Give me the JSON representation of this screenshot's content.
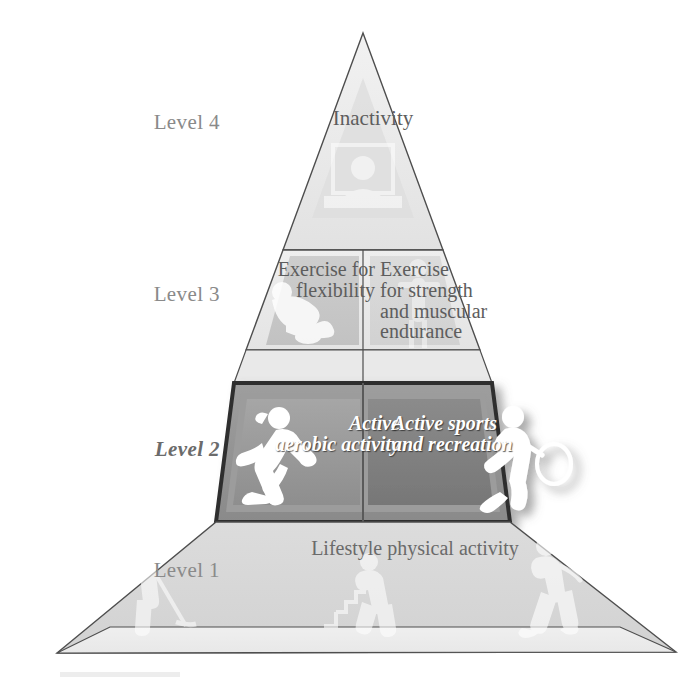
{
  "diagram": {
    "type": "physical-activity-pyramid",
    "orientation": "apex-up",
    "highlighted_level": "Level 2",
    "tier_count": 4
  },
  "side_labels": {
    "level4": "Level 4",
    "level3": "Level 3",
    "level2": "Level 2",
    "level1": "Level 1"
  },
  "tiers": {
    "level4": {
      "label": "Level 4",
      "panels": [
        {
          "text": "Inactivity",
          "icon": "person-watching-tv-icon"
        }
      ]
    },
    "level3": {
      "label": "Level 3",
      "panels": [
        {
          "text": "Exercise for\nflexibility",
          "icon": "person-stretching-icon"
        },
        {
          "text": "Exercise\nfor strength\nand muscular\nendurance",
          "icon": "person-lifting-weights-icon"
        }
      ]
    },
    "level2": {
      "label": "Level 2",
      "emphasized": true,
      "panels": [
        {
          "text": "Active\naerobic activity",
          "icon": "person-running-icon"
        },
        {
          "text": "Active sports\nand recreation",
          "icon": "person-playing-tennis-icon"
        }
      ]
    },
    "level1": {
      "label": "Level 1",
      "panels": [
        {
          "text": "Lifestyle physical activity",
          "icon": "person-raking-icon"
        },
        {
          "text": "",
          "icon": "person-climbing-stairs-icon"
        },
        {
          "text": "",
          "icon": "person-walking-icon"
        }
      ]
    }
  },
  "colors": {
    "outline": "#4e4e4e",
    "tier4_fill": "#e6e6e6",
    "tier3_fill": "#eaeaea",
    "tier3_panel": "#c9c9c9",
    "tier2_band": "#8f8f8f",
    "tier2_panel_left": "#9a9a9a",
    "tier2_panel_right": "#7e7e7e",
    "tier2_border": "#3d3d3d",
    "tier1_fill": "#d6d6d6",
    "page_background": "#ffffff",
    "label_text": "#8a8a8a",
    "panel_text": "#5d5d5d",
    "highlight_text": "#ffffff"
  }
}
